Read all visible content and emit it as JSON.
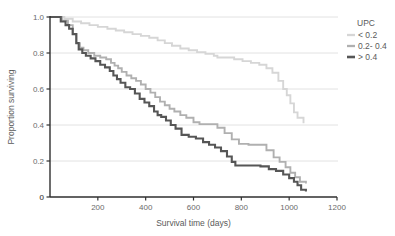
{
  "chart_data": {
    "type": "line",
    "title": "",
    "subtitle": "",
    "xlabel": "Survival time (days)",
    "ylabel": "Proportion surviving",
    "xlim": [
      0,
      1200
    ],
    "ylim": [
      0,
      1.0
    ],
    "xticks": [
      "0",
      "200",
      "400",
      "600",
      "800",
      "1000",
      "1200"
    ],
    "xtick_values": [
      0,
      200,
      400,
      600,
      800,
      1000,
      1200
    ],
    "yticks": [
      "0",
      "0.2",
      "0.4",
      "0.6",
      "0.8",
      "1.0"
    ],
    "ytick_values": [
      0,
      0.2,
      0.4,
      0.6,
      0.8,
      1.0
    ],
    "grid": "horizontal",
    "legend_position": "right",
    "legend_title": "UPC",
    "step_type": "post",
    "series": [
      {
        "name": "< 0.2",
        "color": "#d6d6d6",
        "x": [
          0,
          60,
          95,
          130,
          165,
          200,
          240,
          275,
          310,
          345,
          380,
          415,
          450,
          480,
          510,
          545,
          580,
          615,
          650,
          685,
          700,
          735,
          770,
          805,
          840,
          875,
          905,
          930,
          955,
          975,
          990,
          1005,
          1020,
          1035,
          1060
        ],
        "y": [
          1.0,
          0.99,
          0.975,
          0.965,
          0.955,
          0.945,
          0.935,
          0.925,
          0.915,
          0.905,
          0.895,
          0.885,
          0.87,
          0.855,
          0.84,
          0.825,
          0.815,
          0.805,
          0.795,
          0.785,
          0.775,
          0.775,
          0.765,
          0.755,
          0.745,
          0.735,
          0.715,
          0.69,
          0.645,
          0.6,
          0.565,
          0.52,
          0.47,
          0.44,
          0.41
        ]
      },
      {
        "name": "0.2- 0.4",
        "color": "#b0b0b0",
        "x": [
          0,
          50,
          75,
          95,
          110,
          125,
          140,
          160,
          185,
          210,
          235,
          255,
          270,
          285,
          300,
          320,
          340,
          360,
          380,
          400,
          420,
          440,
          460,
          480,
          500,
          520,
          545,
          570,
          600,
          625,
          660,
          700,
          730,
          760,
          790,
          830,
          870,
          905,
          935,
          960,
          985,
          1005,
          1025,
          1045,
          1070
        ],
        "y": [
          1.0,
          0.98,
          0.955,
          0.905,
          0.855,
          0.83,
          0.815,
          0.8,
          0.785,
          0.775,
          0.765,
          0.745,
          0.73,
          0.715,
          0.695,
          0.675,
          0.66,
          0.645,
          0.625,
          0.6,
          0.58,
          0.555,
          0.53,
          0.51,
          0.49,
          0.475,
          0.455,
          0.44,
          0.415,
          0.405,
          0.405,
          0.385,
          0.355,
          0.32,
          0.295,
          0.29,
          0.29,
          0.26,
          0.22,
          0.195,
          0.165,
          0.135,
          0.11,
          0.085,
          0.075
        ]
      },
      {
        "name": "> 0.4",
        "color": "#565656",
        "x": [
          0,
          45,
          65,
          80,
          95,
          110,
          120,
          135,
          150,
          170,
          190,
          210,
          230,
          250,
          265,
          280,
          295,
          315,
          335,
          355,
          375,
          395,
          415,
          435,
          450,
          465,
          485,
          505,
          525,
          550,
          580,
          610,
          640,
          665,
          690,
          715,
          740,
          760,
          775,
          800,
          840,
          880,
          915,
          945,
          975,
          1000,
          1020,
          1035,
          1050,
          1070
        ],
        "y": [
          1.0,
          0.975,
          0.955,
          0.935,
          0.905,
          0.855,
          0.82,
          0.8,
          0.785,
          0.77,
          0.755,
          0.735,
          0.72,
          0.7,
          0.675,
          0.655,
          0.635,
          0.61,
          0.6,
          0.575,
          0.545,
          0.525,
          0.505,
          0.475,
          0.455,
          0.445,
          0.425,
          0.4,
          0.38,
          0.345,
          0.335,
          0.325,
          0.305,
          0.29,
          0.275,
          0.255,
          0.225,
          0.195,
          0.175,
          0.175,
          0.175,
          0.17,
          0.155,
          0.145,
          0.125,
          0.105,
          0.085,
          0.065,
          0.04,
          0.03
        ]
      }
    ]
  },
  "legend": {
    "title": "UPC",
    "items": [
      {
        "label": "< 0.2",
        "color": "#d6d6d6"
      },
      {
        "label": "0.2- 0.4",
        "color": "#b0b0b0"
      },
      {
        "label": "> 0.4",
        "color": "#565656"
      }
    ]
  },
  "axes": {
    "x_title": "Survival time (days)",
    "y_title": "Proportion surviving"
  },
  "colors": {
    "axis": "#2f2f2f",
    "grid": "#e2e2e2",
    "tick_text": "#6b6b6b",
    "title_text": "#5a5a5a",
    "background": "#ffffff"
  }
}
